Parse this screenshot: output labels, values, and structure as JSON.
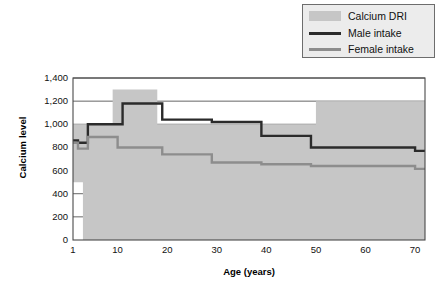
{
  "chart_data": {
    "type": "area",
    "title": "",
    "xlabel": "Age (years)",
    "ylabel": "Calcium level",
    "xlim": [
      1,
      72
    ],
    "ylim": [
      0,
      1400
    ],
    "grid": true,
    "legend_position": "top-right",
    "x_ticks": [
      "1",
      "10",
      "20",
      "30",
      "40",
      "50",
      "60",
      "70"
    ],
    "x_tick_values": [
      1,
      10,
      20,
      30,
      40,
      50,
      60,
      70
    ],
    "y_ticks": [
      "0",
      "200",
      "400",
      "600",
      "800",
      "1,000",
      "1,200",
      "1,400"
    ],
    "y_tick_values": [
      0,
      200,
      400,
      600,
      800,
      1000,
      1200,
      1400
    ],
    "legend": [
      {
        "label": "Calcium DRI",
        "type": "area",
        "color": "#c6c6c6"
      },
      {
        "label": "Male intake",
        "type": "line",
        "color": "#2b2b2b"
      },
      {
        "label": "Female intake",
        "type": "line",
        "color": "#8d8d8d"
      }
    ],
    "series": [
      {
        "name": "Calcium DRI",
        "type": "band",
        "color": "#c6c6c6",
        "x": [
          1,
          3,
          3,
          9,
          9,
          18,
          18,
          50,
          50,
          72
        ],
        "upper": [
          1000,
          1000,
          1000,
          1000,
          1300,
          1300,
          1000,
          1000,
          1200,
          1200
        ],
        "lower": [
          500,
          500,
          0,
          0,
          0,
          0,
          0,
          0,
          0,
          0
        ]
      },
      {
        "name": "Male intake",
        "type": "line",
        "color": "#2b2b2b",
        "x": [
          1,
          2,
          3,
          4,
          9,
          11,
          18,
          19,
          28,
          29,
          38,
          39,
          48,
          49,
          69,
          70,
          72
        ],
        "values": [
          860,
          840,
          840,
          1000,
          1000,
          1180,
          1180,
          1040,
          1040,
          1020,
          1020,
          900,
          900,
          800,
          800,
          770,
          770
        ]
      },
      {
        "name": "Female intake",
        "type": "line",
        "color": "#8d8d8d",
        "x": [
          1,
          2,
          3,
          4,
          9,
          10,
          18,
          19,
          28,
          29,
          38,
          39,
          48,
          49,
          69,
          70,
          72
        ],
        "values": [
          840,
          790,
          790,
          890,
          890,
          800,
          800,
          740,
          740,
          670,
          670,
          655,
          655,
          640,
          640,
          615,
          615
        ]
      }
    ]
  }
}
